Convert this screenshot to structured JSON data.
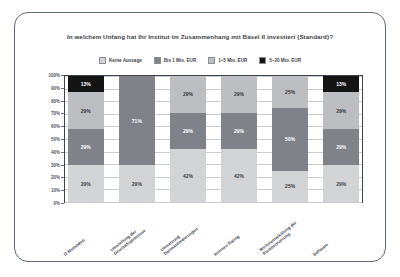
{
  "chart_data": {
    "type": "bar",
    "title": "In welchem Unfang hat Ihr Institut im Zusammenhang mit Basel II investiert (Standard)?",
    "xlabel": "",
    "ylabel": "",
    "ylim": [
      0,
      100
    ],
    "grid": true,
    "stacked": true,
    "stack_mode": "percent",
    "legend_position": "top",
    "categories": [
      "IT-Methoden",
      "Umstellung der\nGeschäftsprozesse",
      "Umsetzung\nDatenanforderungen",
      "Internes Rating",
      "Weiterentwicklung der\nRisikosteuerung",
      "Software"
    ],
    "ytick_labels": [
      "100%",
      "90%",
      "80%",
      "70%",
      "60%",
      "50%",
      "40%",
      "30%",
      "20%",
      "10%",
      "0%"
    ],
    "ytick_values": [
      100,
      90,
      80,
      70,
      60,
      50,
      40,
      30,
      20,
      10,
      0
    ],
    "series": [
      {
        "name": "Keine Aussage",
        "color": "#d3d4d6",
        "values": [
          29,
          29,
          42,
          42,
          25,
          29
        ],
        "labels": [
          "29%",
          "29%",
          "42%",
          "42%",
          "25%",
          "29%"
        ]
      },
      {
        "name": "Bis 1 Mio. EUR",
        "color": "#7f8288",
        "values": [
          29,
          71,
          29,
          29,
          50,
          29
        ],
        "labels": [
          "29%",
          "71%",
          "29%",
          "29%",
          "50%",
          "29%"
        ]
      },
      {
        "name": "1–5 Mio. EUR",
        "color": "#bcbec1",
        "values": [
          29,
          0,
          29,
          29,
          25,
          29
        ],
        "labels": [
          "29%",
          "",
          "29%",
          "29%",
          "25%",
          "29%"
        ]
      },
      {
        "name": "5–20 Mio. EUR",
        "color": "#141414",
        "values": [
          13,
          0,
          0,
          0,
          0,
          13
        ],
        "labels": [
          "13%",
          "",
          "",
          "",
          "",
          "13%"
        ]
      }
    ]
  }
}
